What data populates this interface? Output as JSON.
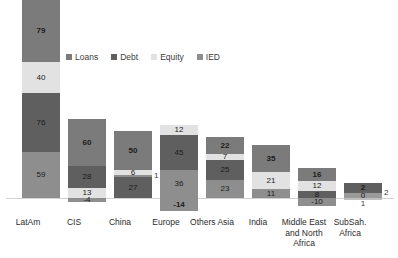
{
  "chart_data": {
    "type": "bar",
    "subtype": "stacked-bar-with-negatives",
    "title": "",
    "subtitle": "",
    "xlabel": "",
    "ylabel": "",
    "grid": false,
    "legend_position": "top",
    "categories": [
      "LatAm",
      "CIS",
      "China",
      "Europe",
      "Others Asia",
      "India",
      "Middle East and North Africa",
      "SubSah. Africa"
    ],
    "series": [
      {
        "name": "Loans",
        "color": "#7b7b7b",
        "values": [
          79,
          60,
          50,
          45,
          22,
          35,
          16,
          2
        ]
      },
      {
        "name": "Debt",
        "color": "#5f5f5f",
        "values": [
          76,
          28,
          27,
          36,
          25,
          21,
          12,
          2
        ]
      },
      {
        "name": "Equity",
        "color": "#e2e2e2",
        "values": [
          40,
          13,
          6,
          12,
          7,
          11,
          8,
          0
        ]
      },
      {
        "name": "IED",
        "color": "#8e8e8e",
        "values": [
          59,
          -4,
          1,
          -14,
          23,
          0,
          10,
          1
        ]
      }
    ],
    "stack_order_top_to_bottom_per_category": {
      "LatAm": [
        "Loans",
        "Equity",
        "Debt",
        "IED"
      ],
      "CIS": [
        "Loans",
        "Debt",
        "Equity",
        "IED"
      ],
      "China": [
        "Loans",
        "Equity",
        "IED",
        "Debt"
      ],
      "Europe": [
        "Equity",
        "Loans",
        "Debt",
        "IED"
      ],
      "Others Asia": [
        "Loans",
        "Equity",
        "Debt",
        "IED"
      ],
      "India": [
        "Loans",
        "Equity",
        "Debt"
      ],
      "Middle East and North Africa": [
        "Loans",
        "Equity",
        "Debt",
        "IED"
      ],
      "SubSah. Africa": [
        "Loans",
        "Debt",
        "Equity",
        "IED"
      ]
    },
    "ylim": [
      -20,
      260
    ]
  },
  "legend": {
    "items": [
      {
        "label": "Loans",
        "color": "#7b7b7b",
        "icon": "square-swatch-icon"
      },
      {
        "label": "Debt",
        "color": "#5f5f5f",
        "icon": "square-swatch-icon"
      },
      {
        "label": "Equity",
        "color": "#e2e2e2",
        "icon": "square-swatch-icon"
      },
      {
        "label": "IED",
        "color": "#8e8e8e",
        "icon": "square-swatch-icon"
      }
    ]
  },
  "bars": [
    {
      "category": "LatAm",
      "left": 18,
      "axis_label_left": 0,
      "positive": [
        {
          "series": "Loans",
          "label": "79",
          "bold": true,
          "height": 62,
          "color": "#7b7b7b",
          "placement": "inside"
        },
        {
          "series": "Equity",
          "label": "40",
          "bold": false,
          "height": 31,
          "color": "#e2e2e2",
          "placement": "inside"
        },
        {
          "series": "Debt",
          "label": "76",
          "bold": false,
          "height": 59,
          "color": "#5f5f5f",
          "placement": "inside"
        },
        {
          "series": "IED",
          "label": "59",
          "bold": false,
          "height": 46,
          "color": "#8e8e8e",
          "placement": "inside"
        }
      ],
      "negative": []
    },
    {
      "category": "CIS",
      "left": 64,
      "axis_label_left": 46,
      "positive": [
        {
          "series": "Loans",
          "label": "60",
          "bold": true,
          "height": 47,
          "color": "#7b7b7b",
          "placement": "inside"
        },
        {
          "series": "Debt",
          "label": "28",
          "bold": false,
          "height": 22,
          "color": "#5f5f5f",
          "placement": "inside"
        },
        {
          "series": "Equity",
          "label": "13",
          "bold": false,
          "height": 10,
          "color": "#e2e2e2",
          "placement": "inside"
        }
      ],
      "negative": [
        {
          "series": "IED",
          "label": "-4",
          "bold": false,
          "height": 4,
          "color": "#8e8e8e",
          "placement": "inside"
        }
      ]
    },
    {
      "category": "China",
      "left": 110,
      "axis_label_left": 92,
      "positive": [
        {
          "series": "Loans",
          "label": "50",
          "bold": true,
          "height": 39,
          "color": "#7b7b7b",
          "placement": "inside"
        },
        {
          "series": "Equity",
          "label": "6",
          "bold": false,
          "height": 5,
          "color": "#e2e2e2",
          "placement": "inside"
        },
        {
          "series": "IED",
          "label": "1",
          "bold": false,
          "height": 2,
          "color": "#8e8e8e",
          "placement": "outside-right"
        },
        {
          "series": "Debt",
          "label": "27",
          "bold": false,
          "height": 21,
          "color": "#5f5f5f",
          "placement": "inside"
        }
      ],
      "negative": []
    },
    {
      "category": "Europe",
      "left": 156,
      "axis_label_left": 138,
      "positive": [
        {
          "series": "Equity",
          "label": "12",
          "bold": false,
          "height": 10,
          "color": "#e2e2e2",
          "placement": "inside"
        },
        {
          "series": "Loans",
          "label": "45",
          "bold": false,
          "height": 35,
          "color": "#5f5f5f",
          "placement": "inside"
        },
        {
          "series": "Debt",
          "label": "36",
          "bold": false,
          "height": 28,
          "color": "#8e8e8e",
          "placement": "inside"
        }
      ],
      "negative": [
        {
          "series": "IED",
          "label": "-14",
          "bold": true,
          "height": 13,
          "color": "#8e8e8e",
          "placement": "inside"
        }
      ]
    },
    {
      "category": "Others Asia",
      "left": 202,
      "axis_label_left": 184,
      "positive": [
        {
          "series": "Loans",
          "label": "22",
          "bold": true,
          "height": 17,
          "color": "#7b7b7b",
          "placement": "inside"
        },
        {
          "series": "Equity",
          "label": "7",
          "bold": false,
          "height": 6,
          "color": "#e2e2e2",
          "placement": "inside"
        },
        {
          "series": "Debt",
          "label": "25",
          "bold": false,
          "height": 20,
          "color": "#5f5f5f",
          "placement": "inside"
        },
        {
          "series": "IED",
          "label": "23",
          "bold": false,
          "height": 18,
          "color": "#8e8e8e",
          "placement": "inside"
        }
      ],
      "negative": []
    },
    {
      "category": "India",
      "left": 248,
      "axis_label_left": 230,
      "positive": [
        {
          "series": "Loans",
          "label": "35",
          "bold": true,
          "height": 27,
          "color": "#7b7b7b",
          "placement": "inside"
        },
        {
          "series": "Equity",
          "label": "21",
          "bold": false,
          "height": 17,
          "color": "#e2e2e2",
          "placement": "inside"
        },
        {
          "series": "Debt",
          "label": "11",
          "bold": false,
          "height": 9,
          "color": "#8e8e8e",
          "placement": "inside"
        }
      ],
      "negative": []
    },
    {
      "category": "Middle East and North Africa",
      "left": 294,
      "axis_label_left": 276,
      "positive": [
        {
          "series": "Loans",
          "label": "16",
          "bold": true,
          "height": 13,
          "color": "#7b7b7b",
          "placement": "inside"
        },
        {
          "series": "Equity",
          "label": "12",
          "bold": false,
          "height": 10,
          "color": "#e2e2e2",
          "placement": "inside"
        },
        {
          "series": "Debt",
          "label": "8",
          "bold": false,
          "height": 7,
          "color": "#5f5f5f",
          "placement": "inside"
        }
      ],
      "negative": [
        {
          "series": "IED",
          "label": "-10",
          "bold": false,
          "height": 8,
          "color": "#8e8e8e",
          "placement": "inside"
        }
      ]
    },
    {
      "category": "SubSah. Africa",
      "left": 340,
      "axis_label_left": 322,
      "positive": [
        {
          "series": "Loans",
          "label": "2",
          "bold": true,
          "height": 10,
          "color": "#5f5f5f",
          "placement": "inside"
        },
        {
          "series": "Debt",
          "label": "2",
          "bold": false,
          "height": 0,
          "color": "#8e8e8e",
          "placement": "outside-right"
        },
        {
          "series": "Equity",
          "label": "0",
          "bold": false,
          "height": 5,
          "color": "#9a9a9a",
          "placement": "inside"
        }
      ],
      "negative": [
        {
          "series": "IED",
          "label": "1",
          "bold": false,
          "height": 2,
          "color": "#bdbdbd",
          "placement": "below"
        }
      ]
    }
  ]
}
